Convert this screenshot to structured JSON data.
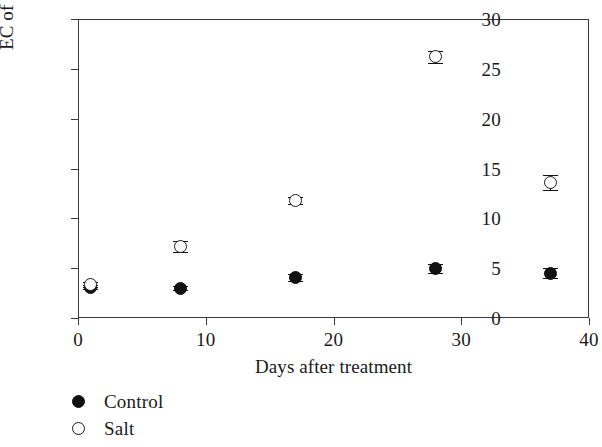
{
  "chart_data": {
    "type": "scatter",
    "title": "",
    "xlabel": "Days after treatment",
    "ylabel": "EC of leachate (ds m⁻¹)",
    "ylabel_text": "EC of leachate (ds m",
    "ylabel_exponent": "−1",
    "ylabel_tail": ")",
    "xlim": [
      0,
      40
    ],
    "ylim": [
      0,
      30
    ],
    "xticks": [
      0,
      10,
      20,
      30,
      40
    ],
    "yticks": [
      0,
      5,
      10,
      15,
      20,
      25,
      30
    ],
    "xtick_labels": [
      "0",
      "10",
      "20",
      "30",
      "40"
    ],
    "ytick_labels": [
      "0",
      "5",
      "10",
      "15",
      "20",
      "25",
      "30"
    ],
    "grid": false,
    "legend_position": "below-plot-left",
    "x": [
      1,
      8,
      17,
      28,
      37
    ],
    "series": [
      {
        "name": "Control",
        "marker": "filled-circle",
        "color": "#111111",
        "values": [
          3.1,
          3.0,
          4.1,
          5.0,
          4.5
        ],
        "errors": [
          0.2,
          0.2,
          0.35,
          0.45,
          0.5
        ]
      },
      {
        "name": "Salt",
        "marker": "open-circle",
        "color": "#1a1a1a",
        "values": [
          3.4,
          7.2,
          11.8,
          26.2,
          13.6
        ],
        "errors": [
          0.25,
          0.55,
          0.35,
          0.6,
          0.75
        ]
      }
    ]
  },
  "legend": {
    "items": [
      {
        "label": "Control",
        "marker": "filled-circle"
      },
      {
        "label": "Salt",
        "marker": "open-circle"
      }
    ]
  }
}
